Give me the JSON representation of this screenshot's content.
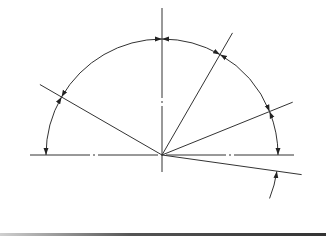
{
  "diagram": {
    "type": "angular dimension drawing",
    "center": [
      162,
      155
    ],
    "radius": 116,
    "stroke_color": "#333333",
    "background": "#ffffff",
    "axes": {
      "horizontal": {
        "x1": 30,
        "x2": 295,
        "y": 155,
        "style": "center-line (dash-dot)"
      },
      "vertical": {
        "x": 162,
        "y1": 8,
        "y2": 172,
        "style": "center-line (dash-dot)"
      }
    },
    "rays_deg": [
      150,
      60,
      22,
      -8
    ],
    "dimension_arcs": [
      {
        "from_deg": 180,
        "to_deg": 150,
        "arrows": "both"
      },
      {
        "from_deg": 150,
        "to_deg": 90,
        "arrows": "both"
      },
      {
        "from_deg": 90,
        "to_deg": 60,
        "arrows": "both"
      },
      {
        "from_deg": 60,
        "to_deg": 22,
        "arrows": "both"
      },
      {
        "from_deg": 22,
        "to_deg": 0,
        "arrows": "both"
      },
      {
        "from_deg": -8,
        "to_deg": -22,
        "arrows": "one (leader from below)"
      }
    ],
    "labels": []
  }
}
